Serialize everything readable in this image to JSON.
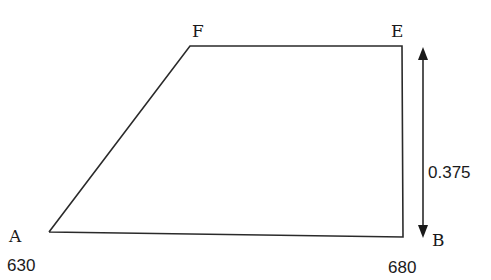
{
  "diagram": {
    "type": "trapezoid",
    "stroke_color": "#2a2a2a",
    "vertices": {
      "A": {
        "label": "A",
        "value": "630"
      },
      "B": {
        "label": "B",
        "value": "680"
      },
      "E": {
        "label": "E"
      },
      "F": {
        "label": "F"
      }
    },
    "edges": [
      "A-F",
      "F-E",
      "E-B",
      "B-A"
    ],
    "dimension": {
      "from": "E",
      "to": "B",
      "label": "0.375",
      "arrow": "double-headed"
    }
  }
}
